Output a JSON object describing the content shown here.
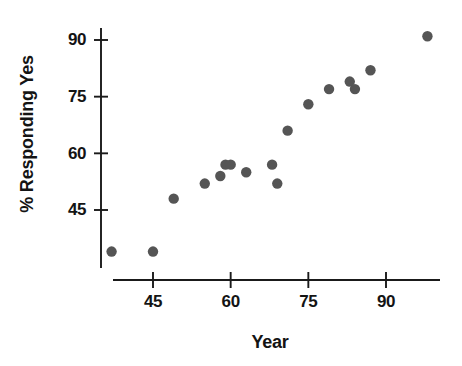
{
  "chart_data": {
    "type": "scatter",
    "title": "",
    "xlabel": "Year",
    "ylabel": "% Responding Yes",
    "xlim": [
      35,
      101
    ],
    "ylim": [
      30,
      96
    ],
    "xticks": [
      45,
      60,
      75,
      90
    ],
    "xticklabels": [
      "45",
      "60",
      "75",
      "90"
    ],
    "yticks": [
      45,
      60,
      75,
      90
    ],
    "yticklabels": [
      "45",
      "60",
      "75",
      "90"
    ],
    "grid": false,
    "legend": null,
    "marker": "circle",
    "marker_color": "#555555",
    "axis_color": "#1a1a1a",
    "points": [
      {
        "x": 37,
        "y": 34
      },
      {
        "x": 45,
        "y": 34
      },
      {
        "x": 49,
        "y": 48
      },
      {
        "x": 55,
        "y": 52
      },
      {
        "x": 58,
        "y": 54
      },
      {
        "x": 59,
        "y": 57
      },
      {
        "x": 60,
        "y": 57
      },
      {
        "x": 63,
        "y": 55
      },
      {
        "x": 68,
        "y": 57
      },
      {
        "x": 69,
        "y": 52
      },
      {
        "x": 71,
        "y": 66
      },
      {
        "x": 75,
        "y": 73
      },
      {
        "x": 79,
        "y": 77
      },
      {
        "x": 83,
        "y": 79
      },
      {
        "x": 84,
        "y": 77
      },
      {
        "x": 87,
        "y": 82
      },
      {
        "x": 98,
        "y": 91
      }
    ]
  },
  "figure": {
    "background": "#ffffff"
  }
}
